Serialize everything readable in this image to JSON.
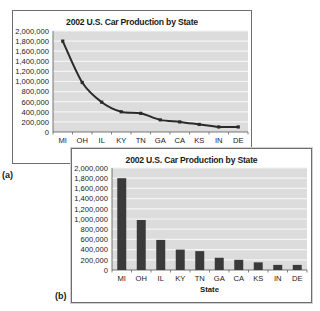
{
  "figure_labels": {
    "a": "(a)",
    "b": "(b)"
  },
  "chart_data": [
    {
      "type": "line",
      "title": "2002 U.S. Car Production by State",
      "xlabel": "",
      "ylabel": "",
      "categories": [
        "MI",
        "OH",
        "IL",
        "KY",
        "TN",
        "GA",
        "CA",
        "KS",
        "IN",
        "DE"
      ],
      "values": [
        1800000,
        980000,
        590000,
        400000,
        370000,
        240000,
        200000,
        150000,
        100000,
        100000
      ],
      "ylim": [
        0,
        2000000
      ],
      "yticks": [
        "0",
        "200,000",
        "400,000",
        "600,000",
        "800,000",
        "1,000,000",
        "1,200,000",
        "1,400,000",
        "1,600,000",
        "1,800,000",
        "2,000,000"
      ],
      "grid": true,
      "legend": "none",
      "colors": {
        "line": "#2a2a2a",
        "plot_bg": "#dcdcdc",
        "grid": "#f4f4f4"
      }
    },
    {
      "type": "bar",
      "title": "2002 U.S. Car Production by State",
      "xlabel": "State",
      "ylabel": "",
      "categories": [
        "MI",
        "OH",
        "IL",
        "KY",
        "TN",
        "GA",
        "CA",
        "KS",
        "IN",
        "DE"
      ],
      "values": [
        1800000,
        980000,
        590000,
        400000,
        370000,
        240000,
        200000,
        150000,
        100000,
        100000
      ],
      "ylim": [
        0,
        2000000
      ],
      "yticks": [
        "0",
        "200,000",
        "400,000",
        "600,000",
        "800,000",
        "1,000,000",
        "1,200,000",
        "1,400,000",
        "1,600,000",
        "1,800,000",
        "2,000,000"
      ],
      "grid": true,
      "legend": "none",
      "colors": {
        "bar": "#3a3a3a",
        "plot_bg": "#dcdcdc",
        "grid": "#f4f4f4"
      }
    }
  ]
}
